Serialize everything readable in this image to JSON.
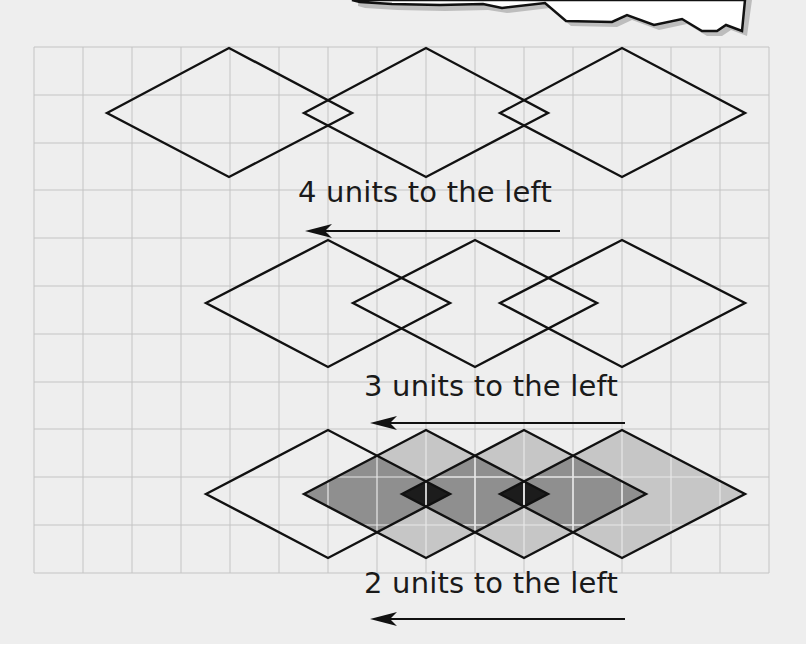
{
  "diagram": {
    "type": "grid-translation-diagram",
    "grid": {
      "columns": 15,
      "rows": 11,
      "unit_px": 49,
      "line_color": "#c4c4c4",
      "background": "#eeeeee"
    },
    "rows": [
      {
        "caption": "4 units to the left",
        "shift_units": 4,
        "diamond_count": 3,
        "shaded": false
      },
      {
        "caption": "3 units to the left",
        "shift_units": 3,
        "diamond_count": 3,
        "shaded": false
      },
      {
        "caption": "2 units to the left",
        "shift_units": 2,
        "diamond_count": 4,
        "shaded": true
      }
    ],
    "arrow_direction": "left",
    "colors": {
      "outline": "#111111",
      "shade_light": "#c6c6c6",
      "shade_medium": "#8f8f8f",
      "shade_dark": "#1c1c1c",
      "torn_paper_fill": "#ffffff",
      "torn_paper_shadow": "#bdbdbd"
    }
  }
}
